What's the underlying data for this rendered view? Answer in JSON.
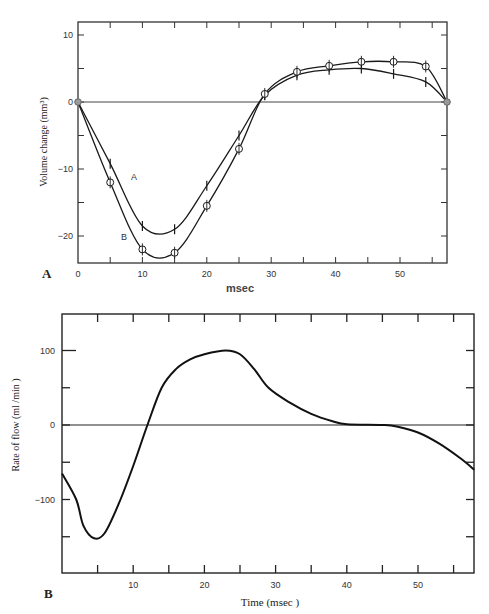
{
  "chart_data": [
    {
      "panel": "A",
      "type": "line",
      "title": "",
      "xlabel": "msec",
      "ylabel": "Volume change (mm³)",
      "xlim": [
        0,
        57.3
      ],
      "ylim": [
        -24,
        12
      ],
      "xticks": [
        0,
        10,
        20,
        30,
        40,
        50
      ],
      "yticks": [
        10,
        0,
        -10,
        -20
      ],
      "grid": false,
      "zero_line": true,
      "series": [
        {
          "name": "A",
          "marker": "tick",
          "x": [
            0,
            5,
            10,
            15,
            20,
            25,
            29,
            34,
            39,
            44,
            49,
            54,
            57.3
          ],
          "values": [
            0,
            -9.2,
            -18.5,
            -19,
            -12.5,
            -5,
            1,
            4,
            4.8,
            5,
            4.2,
            3,
            0
          ]
        },
        {
          "name": "B",
          "marker": "circle",
          "x": [
            0,
            5,
            10,
            15,
            20,
            25,
            29,
            34,
            39,
            44,
            49,
            54,
            57.3
          ],
          "values": [
            0,
            -12,
            -22,
            -22.5,
            -15.5,
            -7,
            1.2,
            4.5,
            5.4,
            6,
            6,
            5.3,
            0
          ]
        }
      ],
      "annotations": [
        "A",
        "B"
      ]
    },
    {
      "panel": "B",
      "type": "line",
      "title": "",
      "xlabel": "Time (msec )",
      "ylabel": "Rate of flow (ml /min )",
      "xlim": [
        0,
        57.9
      ],
      "ylim": [
        -200,
        150
      ],
      "xticks": [
        10,
        20,
        30,
        40,
        50
      ],
      "yticks": [
        100,
        0,
        -100
      ],
      "grid": false,
      "zero_line": true,
      "series": [
        {
          "name": "Rate of flow",
          "x": [
            0,
            2,
            3,
            4.5,
            6,
            8,
            10,
            12,
            14,
            16,
            18,
            20,
            23,
            25,
            27,
            29,
            32,
            35,
            38,
            40,
            45,
            47,
            50,
            53,
            56,
            57.9
          ],
          "values": [
            -65,
            -100,
            -135,
            -152,
            -145,
            -105,
            -55,
            0,
            50,
            75,
            88,
            95,
            100,
            95,
            75,
            50,
            30,
            15,
            5,
            1,
            0,
            -2,
            -10,
            -25,
            -45,
            -60
          ]
        }
      ]
    }
  ],
  "labels": {
    "panel_a": "A",
    "panel_b": "B",
    "a_xlabel": "msec",
    "a_ylabel": "Volume change (mm³)",
    "b_xlabel": "Time (msec )",
    "b_ylabel": "Rate of flow (ml /min )",
    "curve_a": "A",
    "curve_b": "B"
  },
  "colors": {
    "ink": "#1a1a1a",
    "axis": "#333333",
    "marker_fill": "#ffffff",
    "endpoint_fill": "#9a9a9a"
  }
}
